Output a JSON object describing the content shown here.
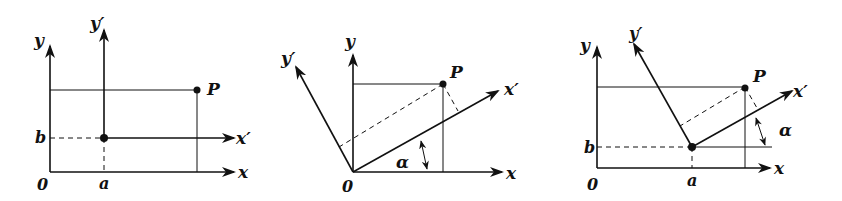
{
  "figure": {
    "colors": {
      "ink": "#111111",
      "background": "#ffffff"
    },
    "panels": [
      {
        "name": "translation",
        "labels": {
          "y": "y",
          "y_prime": "y′",
          "x": "x",
          "x_prime": "x′",
          "origin": "0",
          "a": "a",
          "b": "b",
          "point": "P"
        }
      },
      {
        "name": "rotation",
        "labels": {
          "y": "y",
          "y_prime": "y′",
          "x": "x",
          "x_prime": "x′",
          "origin": "0",
          "angle": "α",
          "point": "P"
        }
      },
      {
        "name": "translation-rotation",
        "labels": {
          "y": "y",
          "y_prime": "y′",
          "x": "x",
          "x_prime": "x′",
          "origin": "0",
          "a": "a",
          "b": "b",
          "angle": "α",
          "point": "P"
        }
      }
    ]
  }
}
